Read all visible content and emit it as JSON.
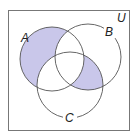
{
  "diagram": {
    "type": "venn",
    "universe_label": "U",
    "sets": [
      {
        "id": "A",
        "label": "A"
      },
      {
        "id": "B",
        "label": "B"
      },
      {
        "id": "C",
        "label": "C"
      }
    ],
    "shaded_regions": [
      "A only (A ∩ B' ∩ C')",
      "(B ∩ C) ∩ A'"
    ],
    "colors": {
      "shade": "#c9c7ea",
      "stroke": "#555555",
      "frame": "#777777",
      "background": "#ffffff"
    }
  }
}
